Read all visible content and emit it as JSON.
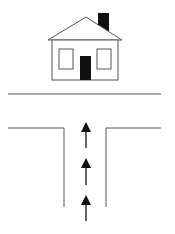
{
  "diagram": {
    "colors": {
      "stroke": "#555555",
      "fill_dark": "#111111",
      "background": "#ffffff"
    },
    "elements": [
      "house",
      "chimney",
      "left-window",
      "right-window",
      "door",
      "ground-line",
      "left-road-edge",
      "right-road-edge",
      "arrow-1",
      "arrow-2",
      "arrow-3"
    ],
    "arrow_count": 3,
    "arrow_direction": "up"
  }
}
